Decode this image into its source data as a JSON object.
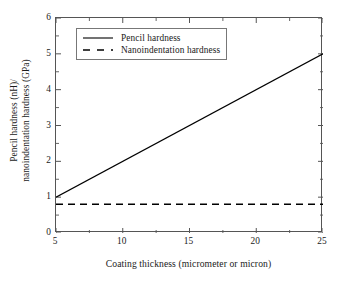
{
  "chart_data": {
    "type": "line",
    "title": "",
    "xlabel": "Coating thickness (micrometer or micron)",
    "ylabel_line1": "Pencil hardness (nH)/",
    "ylabel_line2": "nanoindentation hardness (GPa)",
    "xlim": [
      5,
      25
    ],
    "ylim": [
      0,
      6
    ],
    "xticks": [
      5,
      10,
      15,
      20,
      25
    ],
    "xtick_labels": [
      "5",
      "10",
      "15",
      "20",
      "25"
    ],
    "yticks": [
      0,
      1,
      2,
      3,
      4,
      5,
      6
    ],
    "ytick_labels": [
      "0",
      "1",
      "2",
      "3",
      "4",
      "5",
      "6"
    ],
    "x_minor_step": 2.5,
    "y_minor_step": 0.5,
    "grid": false,
    "legend_position": "upper left",
    "frame": true,
    "tick_direction": "in",
    "series": [
      {
        "name": "Pencil hardness",
        "style": "solid",
        "color": "#000000",
        "x": [
          5,
          25
        ],
        "values": [
          1.0,
          5.0
        ]
      },
      {
        "name": "Nanoindentation hardness",
        "style": "dashed",
        "color": "#000000",
        "x": [
          5,
          25
        ],
        "values": [
          0.8,
          0.8
        ]
      }
    ]
  },
  "legend": {
    "items": [
      {
        "label": "Pencil hardness",
        "style": "solid"
      },
      {
        "label": "Nanoindentation hardness",
        "style": "dashed"
      }
    ]
  }
}
